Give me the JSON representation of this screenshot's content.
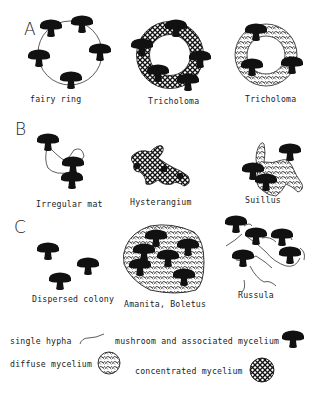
{
  "figure": {
    "background": "#ffffff",
    "ink": "#111111",
    "sections": [
      {
        "label": "A",
        "panels": [
          {
            "caption": "fairy ring",
            "pattern": "single-hypha-ring",
            "mushrooms": 5
          },
          {
            "caption": "Tricholoma",
            "pattern": "concentrated-mycelium-ring",
            "mushrooms": 5
          },
          {
            "caption": "Tricholoma",
            "pattern": "diffuse-mycelium-ring",
            "mushrooms": 3
          }
        ]
      },
      {
        "label": "B",
        "panels": [
          {
            "caption": "Irregular mat",
            "pattern": "single-hypha",
            "mushrooms": 3
          },
          {
            "caption": "Hysterangium",
            "pattern": "concentrated-mycelium",
            "mushrooms": 0
          },
          {
            "caption": "Suillus",
            "pattern": "diffuse-mycelium",
            "mushrooms": 3
          }
        ]
      },
      {
        "label": "C",
        "panels": [
          {
            "caption": "Dispersed colony",
            "pattern": "none",
            "mushrooms": 3
          },
          {
            "caption": "Amanita, Boletus",
            "pattern": "diffuse-mycelium",
            "mushrooms": 6
          },
          {
            "caption": "Russula",
            "pattern": "single-hypha",
            "mushrooms": 5
          }
        ]
      }
    ],
    "legend": {
      "single_hypha": "single hypha",
      "mushroom": "mushroom and associated mycelium",
      "diffuse": "diffuse mycelium",
      "concentrated": "concentrated mycelium"
    }
  }
}
